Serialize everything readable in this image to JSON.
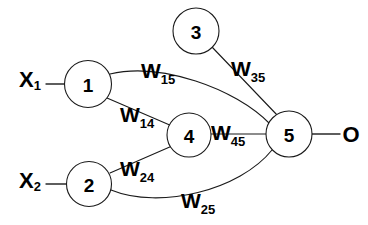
{
  "diagram": {
    "type": "neural-network-graph",
    "background_color": "#ffffff",
    "stroke_color": "#1a1a1a",
    "text_color": "#000000"
  },
  "inputs": [
    {
      "id": "x1",
      "base": "X",
      "subscript": "1",
      "label": "X1",
      "x": 30,
      "y": 79
    },
    {
      "id": "x2",
      "base": "X",
      "subscript": "2",
      "label": "X2",
      "x": 30,
      "y": 180
    }
  ],
  "output": {
    "id": "o",
    "label": "O",
    "x": 351,
    "y": 134
  },
  "nodes": [
    {
      "id": "n1",
      "label": "1",
      "cx": 88,
      "cy": 84,
      "r": 23.5
    },
    {
      "id": "n2",
      "label": "2",
      "cx": 89,
      "cy": 184,
      "r": 22.5
    },
    {
      "id": "n3",
      "label": "3",
      "cx": 196,
      "cy": 31,
      "r": 23
    },
    {
      "id": "n4",
      "label": "4",
      "cx": 189,
      "cy": 135,
      "r": 22
    },
    {
      "id": "n5",
      "label": "5",
      "cx": 289,
      "cy": 134,
      "r": 23
    }
  ],
  "edges": [
    {
      "id": "e15",
      "from": "n1",
      "to": "n5",
      "shape": "curve",
      "path": "M 110 74 C 160 62, 235 88, 270 124",
      "weight": {
        "base": "W",
        "subscript": "15",
        "label": "W15",
        "x": 141,
        "y": 78
      }
    },
    {
      "id": "e14",
      "from": "n1",
      "to": "n4",
      "shape": "line",
      "path": "M 107 98 L 172 126",
      "weight": {
        "base": "W",
        "subscript": "14",
        "label": "W14",
        "x": 120,
        "y": 122
      }
    },
    {
      "id": "e24",
      "from": "n2",
      "to": "n4",
      "shape": "line",
      "path": "M 110 173 L 172 146",
      "weight": {
        "base": "W",
        "subscript": "24",
        "label": "W24",
        "x": 120,
        "y": 176
      }
    },
    {
      "id": "e25",
      "from": "n2",
      "to": "n5",
      "shape": "curve",
      "path": "M 111 190 C 160 210, 240 190, 272 150",
      "weight": {
        "base": "W",
        "subscript": "25",
        "label": "W25",
        "x": 181,
        "y": 208
      }
    },
    {
      "id": "e35",
      "from": "n3",
      "to": "n5",
      "shape": "line",
      "path": "M 212 47 L 278 116",
      "weight": {
        "base": "W",
        "subscript": "35",
        "label": "W35",
        "x": 231,
        "y": 76
      }
    },
    {
      "id": "e45",
      "from": "n4",
      "to": "n5",
      "shape": "line",
      "path": "M 211 134 L 266 134",
      "weight": {
        "base": "W",
        "subscript": "45",
        "label": "W45",
        "x": 211,
        "y": 140
      }
    }
  ],
  "io_connectors": [
    {
      "id": "in1",
      "path": "M 46 84 L 65 84"
    },
    {
      "id": "in2",
      "path": "M 46 184 L 67 184"
    },
    {
      "id": "out1",
      "path": "M 312 134 L 340 134"
    }
  ]
}
